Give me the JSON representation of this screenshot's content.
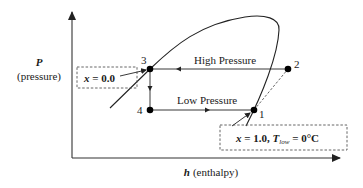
{
  "diagram": {
    "y_axis": {
      "symbol": "P",
      "label": "(pressure)"
    },
    "x_axis": {
      "symbol": "h",
      "label": "(enthalpy)"
    },
    "points": [
      {
        "id": "1",
        "label": "1"
      },
      {
        "id": "2",
        "label": "2"
      },
      {
        "id": "3",
        "label": "3"
      },
      {
        "id": "4",
        "label": "4"
      }
    ],
    "lines": {
      "high_pressure": "High Pressure",
      "low_pressure": "Low Pressure"
    },
    "annotations": {
      "left_box": {
        "var": "x",
        "eq": " = 0.0"
      },
      "right_box": {
        "var": "x",
        "eq1": " = 1.0, ",
        "tvar": "T",
        "tsub": "low",
        "eq2": " = 0°C"
      }
    },
    "colors": {
      "line": "#222222",
      "dash": "#555555",
      "point": "#000000"
    }
  }
}
